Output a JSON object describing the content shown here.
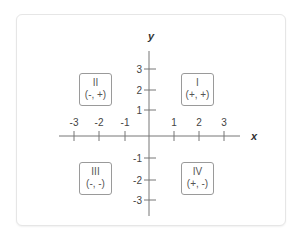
{
  "diagram": {
    "axes": {
      "x_label": "x",
      "y_label": "y",
      "x_ticks": [
        "-3",
        "-2",
        "-1",
        "1",
        "2",
        "3"
      ],
      "y_ticks": [
        "3",
        "2",
        "1",
        "-1",
        "-2",
        "-3"
      ]
    },
    "quadrants": [
      {
        "numeral": "I",
        "signs": "(+, +)"
      },
      {
        "numeral": "II",
        "signs": "(-, +)"
      },
      {
        "numeral": "III",
        "signs": "(-, -)"
      },
      {
        "numeral": "IV",
        "signs": "(+, -)"
      }
    ],
    "colors": {
      "axis": "#777777",
      "text": "#444444",
      "box_border": "#9a9a9a"
    }
  }
}
